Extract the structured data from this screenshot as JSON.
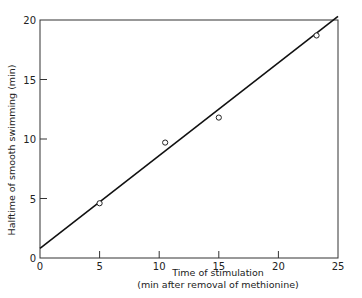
{
  "chart_data": {
    "type": "scatter",
    "title": "",
    "xlabel": "Time of stimulation",
    "xlabel_sub": "(min after removal of methionine)",
    "ylabel": "Halftime of smooth swimming (min)",
    "xlim": [
      0,
      25
    ],
    "ylim": [
      0,
      20
    ],
    "x_ticks": [
      0,
      5,
      10,
      15,
      20,
      25
    ],
    "y_ticks": [
      0,
      5,
      10,
      15,
      20
    ],
    "grid": false,
    "legend": null,
    "series": [
      {
        "name": "measured",
        "marker": "open-circle",
        "x": [
          5,
          10.5,
          15,
          23.2
        ],
        "y": [
          4.6,
          9.7,
          11.8,
          18.7
        ]
      },
      {
        "name": "fit-line",
        "type": "line",
        "x": [
          0,
          25
        ],
        "y": [
          0.8,
          20.3
        ]
      }
    ]
  },
  "labels": {
    "x_ticks": [
      "0",
      "5",
      "10",
      "15",
      "20",
      "25"
    ],
    "y_ticks": [
      "0",
      "5",
      "10",
      "15",
      "20"
    ]
  }
}
